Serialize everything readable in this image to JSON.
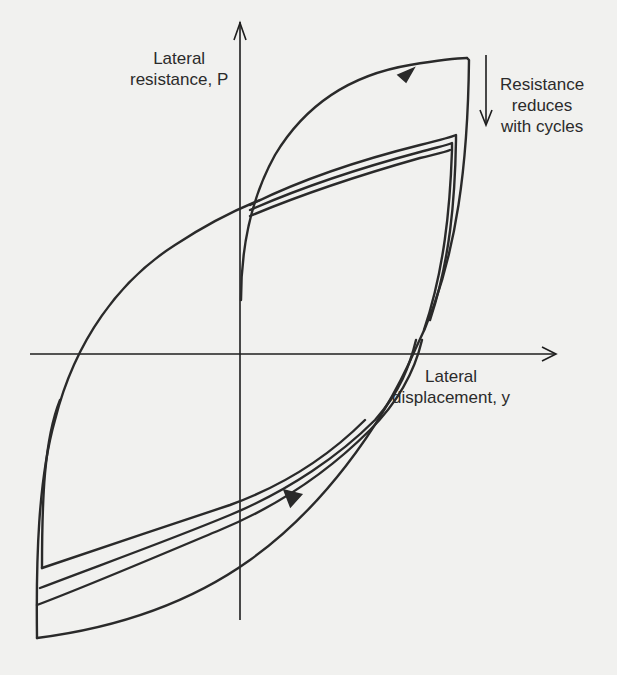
{
  "figure": {
    "type": "hysteresis-diagram",
    "y_axis_label": [
      "Lateral",
      "resistance, P"
    ],
    "x_axis_label": [
      "Lateral",
      "displacement, y"
    ],
    "annotation": [
      "Resistance",
      "reduces",
      "with cycles"
    ],
    "annotation_arrow": "down-arrow",
    "loop_direction_arrows": [
      "upper-branch-right-arrow",
      "unloading-down-left-arrow"
    ],
    "loops": [
      {
        "cycle": 1,
        "peak_positive": "highest",
        "peak_negative": "lowest"
      },
      {
        "cycle": 2,
        "peak_positive": "middle",
        "peak_negative": "middle"
      },
      {
        "cycle": 3,
        "peak_positive": "lower",
        "peak_negative": "upper"
      }
    ],
    "colors": {
      "background": "#f1f1ef",
      "ink": "#2a2a2a"
    }
  }
}
